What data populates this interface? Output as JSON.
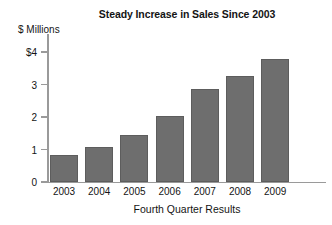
{
  "chart_data": {
    "type": "bar",
    "title": "Steady Increase in Sales Since 2003",
    "xlabel": "Fourth Quarter Results",
    "ylabel": "$ Millions",
    "categories": [
      "2003",
      "2004",
      "2005",
      "2006",
      "2007",
      "2008",
      "2009"
    ],
    "values": [
      0.83,
      1.07,
      1.45,
      2.03,
      2.85,
      3.26,
      3.79
    ],
    "ylim": [
      0,
      4
    ],
    "ytick_values": [
      4,
      3,
      2,
      1,
      0
    ],
    "ytick_labels": [
      "$4",
      "3",
      "2",
      "1",
      "0"
    ],
    "grid": false,
    "legend": null,
    "series": [
      {
        "name": "Sales",
        "values": [
          0.83,
          1.07,
          1.45,
          2.03,
          2.85,
          3.26,
          3.79
        ]
      }
    ],
    "colors": {
      "bar_fill": "#6e6e6e",
      "bar_stroke": "#5d5d5d",
      "axis_line": "#9a9a9a",
      "text": "#141414",
      "background": "#ffffff"
    }
  }
}
